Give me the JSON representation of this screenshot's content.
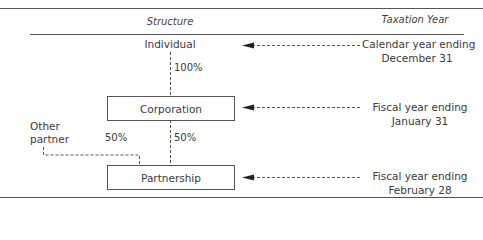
{
  "headers": {
    "structure": "Structure",
    "taxation_year": "Taxation Year"
  },
  "entities": {
    "individual": "Individual",
    "corporation": "Corporation",
    "partnership": "Partnership",
    "other_partner": "Other\npartner"
  },
  "ownership": {
    "individual_to_corporation": "100%",
    "other_partner_to_partnership": "50%",
    "corporation_to_partnership": "50%"
  },
  "taxation_years": {
    "individual": {
      "line1": "Calendar year ending",
      "line2": "December 31"
    },
    "corporation": {
      "line1": "Fiscal year ending",
      "line2": "January 31"
    },
    "partnership": {
      "line1": "Fiscal year ending",
      "line2": "February 28"
    }
  },
  "colors": {
    "line": "#555555",
    "text": "#3a3a3a"
  }
}
